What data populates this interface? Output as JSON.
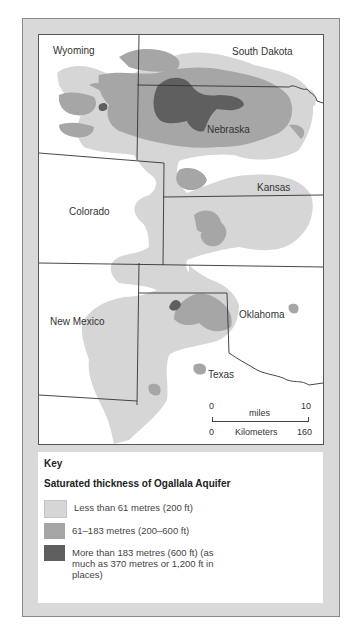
{
  "map": {
    "states": [
      {
        "name": "Wyoming",
        "label": "Wyoming"
      },
      {
        "name": "South Dakota",
        "label": "South Dakota"
      },
      {
        "name": "Nebraska",
        "label": "Nebraska"
      },
      {
        "name": "Kansas",
        "label": "Kansas"
      },
      {
        "name": "Colorado",
        "label": "Colorado"
      },
      {
        "name": "New Mexico",
        "label": "New Mexico"
      },
      {
        "name": "Oklahoma",
        "label": "Oklahoma"
      },
      {
        "name": "Texas",
        "label": "Texas"
      }
    ],
    "scale_bar": {
      "miles_start": "0",
      "miles_label": "miles",
      "miles_end": "10",
      "km_start": "0",
      "km_label": "Kilometers",
      "km_end": "160"
    }
  },
  "key": {
    "title": "Key",
    "subtitle": "Saturated thickness of Ogallala Aquifer",
    "items": [
      {
        "label": "Less than 61 metres (200 ft)",
        "color": "#d6d6d6"
      },
      {
        "label": "61–183 metres (200–600 ft)",
        "color": "#a6a6a6"
      },
      {
        "label": "More than 183 metres (600 ft) (as much as 370 metres or 1,200 ft in places)",
        "color": "#5f5f5f"
      }
    ]
  }
}
